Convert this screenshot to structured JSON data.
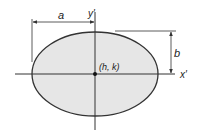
{
  "diagram": {
    "type": "ellipse-with-translated-axes",
    "labels": {
      "a": "a",
      "b": "b",
      "y_axis": "y′",
      "x_axis": "x′",
      "center": "(h, k)"
    },
    "colors": {
      "ellipse_fill": "#e6e6e6",
      "stroke": "#333333",
      "text": "#222222",
      "background": "#ffffff"
    }
  }
}
